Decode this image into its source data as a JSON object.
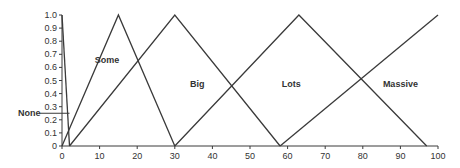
{
  "chart_data": {
    "type": "line",
    "title": "",
    "xlabel": "",
    "ylabel": "",
    "xlim": [
      0,
      100
    ],
    "ylim": [
      0,
      1.0
    ],
    "grid": false,
    "x_ticks": [
      0,
      10,
      20,
      30,
      40,
      50,
      60,
      70,
      80,
      90,
      100
    ],
    "y_ticks": [
      0,
      0.1,
      0.2,
      0.3,
      0.4,
      0.5,
      0.6,
      0.7,
      0.8,
      0.9,
      1.0
    ],
    "y_tick_labels": [
      "0",
      "0.1",
      "0.2",
      "0.3",
      "0.4",
      "0.5",
      "0.6",
      "0.7",
      "0.8",
      "0.9",
      "1.0"
    ],
    "series": [
      {
        "name": "None",
        "points": [
          [
            0,
            1
          ],
          [
            2,
            0
          ]
        ]
      },
      {
        "name": "Some",
        "points": [
          [
            0,
            0
          ],
          [
            15,
            1
          ],
          [
            30,
            0
          ]
        ]
      },
      {
        "name": "Big",
        "points": [
          [
            2,
            0
          ],
          [
            30,
            1
          ],
          [
            58,
            0
          ]
        ]
      },
      {
        "name": "Lots",
        "points": [
          [
            30,
            0
          ],
          [
            63,
            1
          ],
          [
            97,
            0
          ]
        ]
      },
      {
        "name": "Massive",
        "points": [
          [
            58,
            0
          ],
          [
            100,
            1
          ]
        ]
      }
    ],
    "annotations": [
      {
        "text": "None",
        "x": -12,
        "y": 0.25,
        "arrow_to": [
          2,
          0.25
        ]
      },
      {
        "text": "Some",
        "x": 12,
        "y": 0.66
      },
      {
        "text": "Big",
        "x": 36,
        "y": 0.47
      },
      {
        "text": "Lots",
        "x": 61,
        "y": 0.47
      },
      {
        "text": "Massive",
        "x": 90,
        "y": 0.47
      }
    ]
  }
}
